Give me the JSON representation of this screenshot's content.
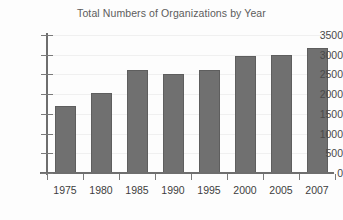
{
  "chart_data": {
    "type": "bar",
    "title": "Total Numbers of Organizations by Year",
    "xlabel": "",
    "ylabel": "",
    "categories": [
      "1975",
      "1980",
      "1985",
      "1990",
      "1995",
      "2000",
      "2005",
      "2007"
    ],
    "values": [
      1700,
      2030,
      2610,
      2500,
      2610,
      2970,
      3000,
      3170
    ],
    "ylim": [
      0,
      3500
    ],
    "yticks": [
      0,
      500,
      1000,
      1500,
      2000,
      2500,
      3000,
      3500
    ],
    "ytick_labels": [
      "0",
      "500",
      "1000",
      "1500",
      "2000",
      "2500",
      "3000",
      "3500"
    ],
    "grid": true,
    "legend": false,
    "series": [
      {
        "name": "Total Numbers of Organizations",
        "values": [
          1700,
          2030,
          2610,
          2500,
          2610,
          2970,
          3000,
          3170
        ]
      }
    ],
    "colors": {
      "bar_fill": "#707070",
      "bar_edge": "#5e5e5e",
      "axis": "#6e6e6e",
      "grid": "#f0f0f0",
      "title_text": "#5c5c5c",
      "tick_text": "#3d3d3d",
      "background": "#fdfdfd"
    }
  }
}
